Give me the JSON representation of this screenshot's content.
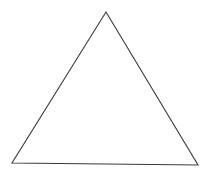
{
  "figure": {
    "background_color": "#ffffff",
    "canvas": {
      "width": 211,
      "height": 172
    },
    "shapes": [
      {
        "name": "triangle",
        "kind": "triangle",
        "classification": "isosceles",
        "filled": false,
        "fill_color": "none",
        "stroke_color": "#3a3a3a",
        "stroke_width": 1.1,
        "points": "106,12 198,165 12,163",
        "vertices": [
          {
            "label": "apex",
            "x": 106,
            "y": 12
          },
          {
            "label": "bottom-right",
            "x": 198,
            "y": 165
          },
          {
            "label": "bottom-left",
            "x": 12,
            "y": 163
          }
        ]
      }
    ]
  }
}
